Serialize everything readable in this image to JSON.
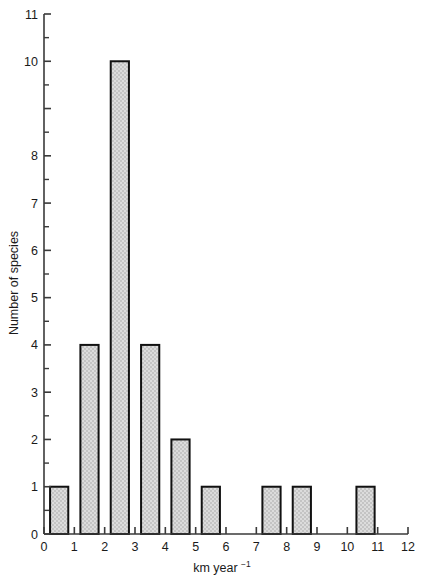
{
  "chart_data": {
    "type": "bar",
    "title": "",
    "subtitle": "",
    "xlabel": "km year⁻¹",
    "ylabel": "Number of species",
    "xlim": [
      0,
      12
    ],
    "ylim": [
      0,
      11
    ],
    "grid": false,
    "legend": null,
    "bar_style": {
      "fill": "#d2d2d2",
      "pattern": "stipple-checker",
      "edge_color": "#111111",
      "edge_width_px": 2,
      "bar_width_units": 0.6
    },
    "axis_color": "#3a3a3a",
    "background": "#ffffff",
    "x_tick_labels": [
      "0",
      "1",
      "2",
      "3",
      "4",
      "5",
      "6",
      "7",
      "8",
      "9",
      "10",
      "11",
      "12"
    ],
    "x_tick_values": [
      0,
      1,
      2,
      3,
      4,
      5,
      6,
      7,
      8,
      9,
      10,
      11,
      12
    ],
    "y_tick_values": [
      0,
      1,
      2,
      3,
      4,
      5,
      6,
      7,
      8,
      9,
      10,
      11
    ],
    "y_tick_labels": [
      "0",
      "1",
      "2",
      "3",
      "4",
      "5",
      "6",
      "7",
      "8",
      "",
      "10",
      "11"
    ],
    "y_minor_ticks": [
      0.5,
      1.5,
      2.5,
      3.5,
      4.5,
      5.5,
      6.5,
      7.5,
      8.5,
      9.5,
      10.5
    ],
    "bars": [
      {
        "label": "0.2–0.8",
        "x_left": 0.2,
        "x_right": 0.8,
        "value": 1
      },
      {
        "label": "1.2–1.8",
        "x_left": 1.2,
        "x_right": 1.8,
        "value": 4
      },
      {
        "label": "2.2–2.8",
        "x_left": 2.2,
        "x_right": 2.8,
        "value": 10
      },
      {
        "label": "3.2–3.8",
        "x_left": 3.2,
        "x_right": 3.8,
        "value": 4
      },
      {
        "label": "4.2–4.8",
        "x_left": 4.2,
        "x_right": 4.8,
        "value": 2
      },
      {
        "label": "5.2–5.8",
        "x_left": 5.2,
        "x_right": 5.8,
        "value": 1
      },
      {
        "label": "7.2–7.8",
        "x_left": 7.2,
        "x_right": 7.8,
        "value": 1
      },
      {
        "label": "8.2–8.8",
        "x_left": 8.2,
        "x_right": 8.8,
        "value": 1
      },
      {
        "label": "10.3–10.9",
        "x_left": 10.3,
        "x_right": 10.9,
        "value": 1
      }
    ],
    "categories": [
      "0.5",
      "1.5",
      "2.5",
      "3.5",
      "4.5",
      "5.5",
      "6.5",
      "7.5",
      "8.5",
      "9.5",
      "10.5",
      "11.5"
    ],
    "values": [
      1,
      4,
      10,
      4,
      2,
      1,
      0,
      1,
      1,
      0,
      1,
      0
    ]
  },
  "axis": {
    "x_title": "km year",
    "x_title_exponent": "−1",
    "y_title": "Number of species"
  }
}
